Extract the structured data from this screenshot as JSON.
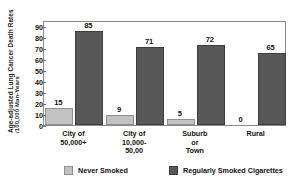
{
  "chart_data": {
    "type": "bar",
    "title": "",
    "xlabel": "",
    "ylabel": "Age-adjusted Lung Cancer Death Rates /100,000 Man-Years",
    "ylabel_line1": "Age-adjusted Lung Cancer Death Rates",
    "ylabel_line2": "/100,000 Man-Years",
    "categories": [
      "City of\n50,000+",
      "City of\n10,000-\n50,00",
      "Suburb\nor\nTown",
      "Rural"
    ],
    "series": [
      {
        "name": "Never Smoked",
        "color": "#c2c2c2",
        "values": [
          15,
          9,
          5,
          0
        ]
      },
      {
        "name": "Regularly Smoked Cigarettes",
        "color": "#585858",
        "values": [
          85,
          71,
          72,
          65
        ]
      }
    ],
    "ylim": [
      0,
      95
    ],
    "yticks": [
      0,
      10,
      20,
      30,
      40,
      50,
      60,
      70,
      80,
      90
    ],
    "ytick_labels": [
      "0",
      "10",
      "20",
      "30",
      "40",
      "50",
      "60",
      "70",
      "80",
      "90"
    ],
    "grid": false,
    "legend_position": "bottom",
    "frame_color": "#8a8a8a"
  },
  "legend": {
    "items": [
      {
        "label": "Never Smoked",
        "color": "#c2c2c2"
      },
      {
        "label": "Regularly Smoked Cigarettes",
        "color": "#585858"
      }
    ]
  }
}
